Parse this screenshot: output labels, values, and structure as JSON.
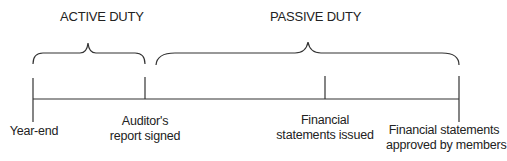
{
  "diagram": {
    "type": "timeline",
    "periods": [
      {
        "label": "ACTIVE DUTY",
        "from": "Year-end",
        "to": "Auditor's report signed"
      },
      {
        "label": "PASSIVE DUTY",
        "from": "Auditor's report signed",
        "to": "Financial statements approved by members"
      }
    ],
    "events": [
      {
        "line1": "Year-end",
        "line2": ""
      },
      {
        "line1": "Auditor's",
        "line2": "report signed"
      },
      {
        "line1": "Financial",
        "line2": "statements issued"
      },
      {
        "line1": "Financial statements",
        "line2": "approved by members"
      }
    ],
    "colors": {
      "line": "#333333",
      "text": "#222222"
    }
  }
}
